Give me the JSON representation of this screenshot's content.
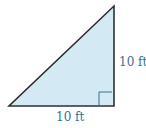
{
  "diagram": {
    "shape": "right-triangle",
    "fill_color": "#d3eaf5",
    "stroke_color": "#333333",
    "label_color": "#3b6f8f",
    "labels": {
      "vertical_side": "10 ft",
      "horizontal_side": "10 ft"
    },
    "right_angle_marker": "bottom-right"
  }
}
